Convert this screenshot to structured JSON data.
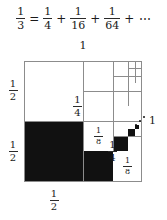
{
  "equation": {
    "lhs": {
      "num": "1",
      "den": "3"
    },
    "equals": "=",
    "terms": [
      {
        "num": "1",
        "den": "4"
      },
      {
        "num": "1",
        "den": "16"
      },
      {
        "num": "1",
        "den": "64"
      }
    ],
    "plus": "+",
    "ellipsis": "⋯",
    "full_text": "1/3 = 1/4 + 1/16 + 1/64 + ⋯"
  },
  "diagram": {
    "top_label": "1",
    "right_label": "1",
    "left_labels": [
      {
        "num": "1",
        "den": "2"
      },
      {
        "num": "1",
        "den": "2"
      }
    ],
    "bottom_label": {
      "num": "1",
      "den": "2"
    },
    "cell_labels": [
      {
        "num": "1",
        "den": "4",
        "id": "quarter-lower"
      },
      {
        "num": "1",
        "den": "4",
        "id": "quarter-upper"
      },
      {
        "num": "1",
        "den": "8",
        "id": "eighth-right"
      },
      {
        "num": "1",
        "den": "8",
        "id": "eighth-top"
      }
    ],
    "colors": {
      "fill": "#111111",
      "stroke": "#8c8c8c",
      "background": "#ffffff",
      "text": "#1a1a1a"
    },
    "shaded_fraction_limit": "1/3",
    "corner_ellipsis": "⋰"
  }
}
